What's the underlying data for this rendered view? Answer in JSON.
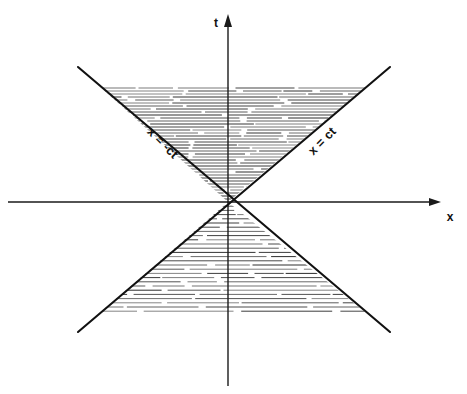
{
  "figure": {
    "background_color": "#ffffff",
    "ink_color": "#111111",
    "width": 467,
    "height": 394
  },
  "axes": {
    "vertical": {
      "label": "t",
      "label_x": 218,
      "label_y": 26,
      "x": 228,
      "y_top": 14,
      "y_bottom": 386,
      "arrow": "up"
    },
    "horizontal": {
      "label": "x",
      "label_x": 450,
      "label_y": 219,
      "y": 202,
      "x_left": 8,
      "x_right": 441,
      "arrow": "right"
    },
    "origin": {
      "x": 228,
      "y": 202
    }
  },
  "cone": {
    "vertex": {
      "x": 228,
      "y": 202
    },
    "slope_label_left": "x = -ct",
    "slope_label_right": "x = ct",
    "left_label": {
      "text": "x = -ct",
      "x": 160,
      "y": 145,
      "rotation": 45
    },
    "right_label": {
      "text": "x = ct",
      "x": 322,
      "y": 143,
      "rotation": -45
    },
    "future": {
      "name": "future-light-cone",
      "apex_y": 202,
      "top_y": 67,
      "left_x": 78,
      "right_x": 390,
      "shading_top_y": 88,
      "hatch_spacing": 3
    },
    "past": {
      "name": "past-light-cone",
      "apex_y": 202,
      "bottom_y": 332,
      "left_x": 78,
      "right_x": 390,
      "shading_bottom_y": 313,
      "hatch_spacing": 4.2
    }
  },
  "chart_data": {
    "type": "line",
    "xlabel": "x",
    "ylabel": "t",
    "grid": false,
    "legend": "none",
    "annotations": [
      "x = -ct",
      "x = ct",
      "t",
      "x"
    ],
    "series": [
      {
        "name": "x = ct",
        "comment": "right-going light ray through origin, slope +1 in (x, ct)",
        "x": [
          -150,
          0,
          150
        ],
        "y": [
          -150,
          0,
          150
        ]
      },
      {
        "name": "x = -ct",
        "comment": "left-going light ray through origin, slope -1 in (x, ct)",
        "x": [
          -150,
          0,
          150
        ],
        "y": [
          150,
          0,
          -150
        ]
      }
    ],
    "regions": [
      {
        "name": "future light cone",
        "shaded": true,
        "hatch": "horizontal"
      },
      {
        "name": "past light cone",
        "shaded": true,
        "hatch": "horizontal"
      }
    ],
    "xlim": [
      -220,
      215
    ],
    "ylim": [
      -185,
      190
    ]
  }
}
